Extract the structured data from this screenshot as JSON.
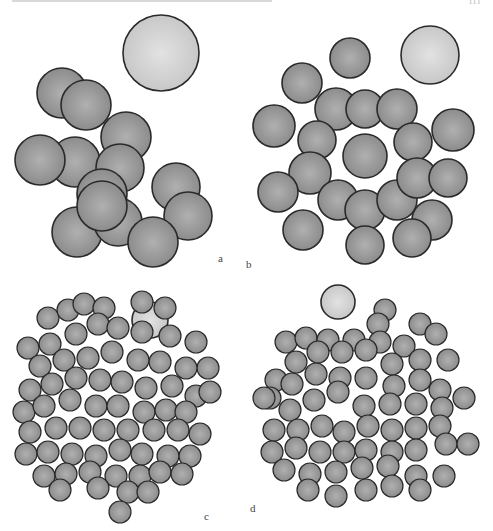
{
  "figure": {
    "page_number": "111",
    "colors": {
      "particle_fill": "#8c8c8c",
      "particle_center": "#b0b0b0",
      "particle_stroke": "#2a2a2a",
      "large_fill": "#c8c8c8",
      "large_center": "#e2e2e2"
    },
    "panels": [
      {
        "id": "a",
        "label": "a",
        "x": 0,
        "y": 20,
        "w": 240,
        "h": 260,
        "label_pos": [
          218,
          232
        ],
        "large": [
          {
            "cx": 161,
            "cy": 33,
            "r": 38
          }
        ],
        "particles": [
          [
            62,
            73,
            25
          ],
          [
            86,
            85,
            25
          ],
          [
            126,
            117,
            25
          ],
          [
            75,
            142,
            25
          ],
          [
            40,
            140,
            25
          ],
          [
            120,
            148,
            24
          ],
          [
            176,
            167,
            24
          ],
          [
            188,
            196,
            24
          ],
          [
            102,
            174,
            25
          ],
          [
            77,
            212,
            25
          ],
          [
            118,
            202,
            24
          ],
          [
            153,
            222,
            25
          ],
          [
            102,
            186,
            25
          ]
        ]
      },
      {
        "id": "b",
        "label": "b",
        "x": 240,
        "y": 20,
        "w": 253,
        "h": 260,
        "label_pos": [
          6,
          238
        ],
        "large": [
          {
            "cx": 190,
            "cy": 35,
            "r": 29
          }
        ],
        "particles": [
          [
            110,
            38,
            20
          ],
          [
            62,
            63,
            20
          ],
          [
            34,
            106,
            21
          ],
          [
            96,
            89,
            21
          ],
          [
            125,
            89,
            19
          ],
          [
            157,
            89,
            20
          ],
          [
            173,
            122,
            19
          ],
          [
            77,
            120,
            19
          ],
          [
            70,
            153,
            21
          ],
          [
            125,
            136,
            22
          ],
          [
            38,
            172,
            20
          ],
          [
            98,
            180,
            20
          ],
          [
            125,
            190,
            20
          ],
          [
            157,
            180,
            20
          ],
          [
            177,
            158,
            20
          ],
          [
            208,
            158,
            19
          ],
          [
            213,
            110,
            21
          ],
          [
            63,
            210,
            20
          ],
          [
            125,
            225,
            19
          ],
          [
            192,
            200,
            20
          ],
          [
            172,
            218,
            19
          ]
        ]
      },
      {
        "id": "c",
        "label": "c",
        "x": 0,
        "y": 280,
        "w": 240,
        "h": 251,
        "label_pos": [
          204,
          230
        ],
        "large": [
          {
            "cx": 150,
            "cy": 40,
            "r": 18
          }
        ],
        "particles": [
          [
            48,
            38,
            11
          ],
          [
            68,
            30,
            11
          ],
          [
            84,
            24,
            11
          ],
          [
            104,
            28,
            11
          ],
          [
            142,
            22,
            11
          ],
          [
            165,
            28,
            11
          ],
          [
            28,
            68,
            11
          ],
          [
            50,
            64,
            11
          ],
          [
            76,
            54,
            11
          ],
          [
            98,
            44,
            11
          ],
          [
            118,
            48,
            11
          ],
          [
            142,
            52,
            11
          ],
          [
            170,
            56,
            11
          ],
          [
            196,
            62,
            11
          ],
          [
            208,
            88,
            11
          ],
          [
            186,
            88,
            11
          ],
          [
            160,
            82,
            11
          ],
          [
            138,
            80,
            11
          ],
          [
            112,
            72,
            11
          ],
          [
            88,
            78,
            11
          ],
          [
            64,
            80,
            11
          ],
          [
            40,
            86,
            11
          ],
          [
            30,
            110,
            11
          ],
          [
            52,
            104,
            11
          ],
          [
            76,
            98,
            11
          ],
          [
            100,
            100,
            11
          ],
          [
            122,
            102,
            11
          ],
          [
            146,
            108,
            11
          ],
          [
            172,
            106,
            11
          ],
          [
            196,
            116,
            11
          ],
          [
            210,
            112,
            11
          ],
          [
            24,
            132,
            11
          ],
          [
            44,
            126,
            11
          ],
          [
            70,
            120,
            11
          ],
          [
            96,
            126,
            11
          ],
          [
            118,
            126,
            11
          ],
          [
            144,
            132,
            11
          ],
          [
            166,
            130,
            11
          ],
          [
            186,
            132,
            11
          ],
          [
            30,
            152,
            11
          ],
          [
            56,
            148,
            11
          ],
          [
            80,
            148,
            11
          ],
          [
            104,
            150,
            11
          ],
          [
            128,
            150,
            11
          ],
          [
            154,
            150,
            11
          ],
          [
            178,
            150,
            11
          ],
          [
            200,
            154,
            11
          ],
          [
            26,
            174,
            11
          ],
          [
            48,
            172,
            11
          ],
          [
            72,
            174,
            11
          ],
          [
            96,
            176,
            11
          ],
          [
            120,
            170,
            11
          ],
          [
            142,
            174,
            11
          ],
          [
            168,
            176,
            11
          ],
          [
            190,
            176,
            11
          ],
          [
            44,
            196,
            11
          ],
          [
            66,
            194,
            11
          ],
          [
            90,
            192,
            11
          ],
          [
            116,
            196,
            11
          ],
          [
            140,
            196,
            11
          ],
          [
            160,
            192,
            11
          ],
          [
            182,
            194,
            11
          ],
          [
            60,
            210,
            11
          ],
          [
            98,
            208,
            11
          ],
          [
            128,
            212,
            11
          ],
          [
            148,
            212,
            11
          ],
          [
            120,
            232,
            11
          ]
        ]
      },
      {
        "id": "d",
        "label": "d",
        "x": 240,
        "y": 280,
        "w": 253,
        "h": 251,
        "label_pos": [
          10,
          222
        ],
        "large": [
          {
            "cx": 98,
            "cy": 22,
            "r": 17
          }
        ],
        "particles": [
          [
            145,
            30,
            11
          ],
          [
            138,
            44,
            11
          ],
          [
            180,
            44,
            11
          ],
          [
            196,
            54,
            11
          ],
          [
            46,
            62,
            11
          ],
          [
            66,
            58,
            11
          ],
          [
            88,
            60,
            11
          ],
          [
            114,
            60,
            11
          ],
          [
            140,
            62,
            11
          ],
          [
            164,
            66,
            11
          ],
          [
            208,
            80,
            11
          ],
          [
            180,
            80,
            11
          ],
          [
            36,
            100,
            11
          ],
          [
            56,
            82,
            11
          ],
          [
            78,
            72,
            11
          ],
          [
            102,
            72,
            11
          ],
          [
            126,
            70,
            11
          ],
          [
            152,
            84,
            11
          ],
          [
            30,
            118,
            11
          ],
          [
            52,
            104,
            11
          ],
          [
            76,
            94,
            11
          ],
          [
            100,
            98,
            11
          ],
          [
            126,
            98,
            11
          ],
          [
            154,
            106,
            11
          ],
          [
            180,
            100,
            11
          ],
          [
            200,
            110,
            11
          ],
          [
            24,
            118,
            11
          ],
          [
            50,
            130,
            11
          ],
          [
            74,
            120,
            11
          ],
          [
            98,
            112,
            11
          ],
          [
            124,
            126,
            11
          ],
          [
            150,
            124,
            11
          ],
          [
            176,
            124,
            11
          ],
          [
            202,
            128,
            11
          ],
          [
            224,
            118,
            11
          ],
          [
            34,
            150,
            11
          ],
          [
            58,
            150,
            11
          ],
          [
            82,
            146,
            11
          ],
          [
            104,
            152,
            11
          ],
          [
            128,
            146,
            11
          ],
          [
            152,
            150,
            11
          ],
          [
            176,
            148,
            11
          ],
          [
            200,
            146,
            11
          ],
          [
            32,
            172,
            11
          ],
          [
            56,
            168,
            11
          ],
          [
            80,
            172,
            11
          ],
          [
            104,
            172,
            11
          ],
          [
            126,
            170,
            11
          ],
          [
            152,
            172,
            11
          ],
          [
            176,
            170,
            11
          ],
          [
            206,
            164,
            11
          ],
          [
            228,
            164,
            11
          ],
          [
            44,
            190,
            11
          ],
          [
            70,
            194,
            11
          ],
          [
            96,
            192,
            11
          ],
          [
            122,
            188,
            11
          ],
          [
            148,
            186,
            11
          ],
          [
            176,
            196,
            11
          ],
          [
            204,
            196,
            11
          ],
          [
            68,
            210,
            11
          ],
          [
            96,
            216,
            11
          ],
          [
            126,
            210,
            11
          ],
          [
            152,
            206,
            11
          ],
          [
            180,
            210,
            11
          ]
        ]
      }
    ]
  }
}
